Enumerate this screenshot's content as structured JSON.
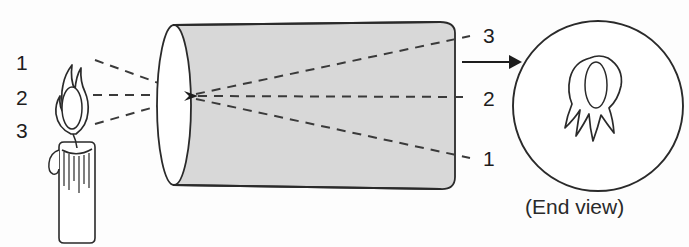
{
  "figure": {
    "background_color": "#fdfdfd",
    "ink_color": "#2a2a2a",
    "cylinder_fill": "#d8d8d8"
  },
  "source_labels": {
    "description": "Numbered points on the candle flame, top to bottom",
    "items": [
      {
        "id": "source-1",
        "text": "1"
      },
      {
        "id": "source-2",
        "text": "2"
      },
      {
        "id": "source-3",
        "text": "3"
      }
    ]
  },
  "image_labels": {
    "description": "Numbered points on the inverted image inside the camera, top to bottom",
    "items": [
      {
        "id": "image-3",
        "text": "3"
      },
      {
        "id": "image-2",
        "text": "2"
      },
      {
        "id": "image-1",
        "text": "1"
      }
    ]
  },
  "end_view": {
    "caption": "(End view)"
  }
}
